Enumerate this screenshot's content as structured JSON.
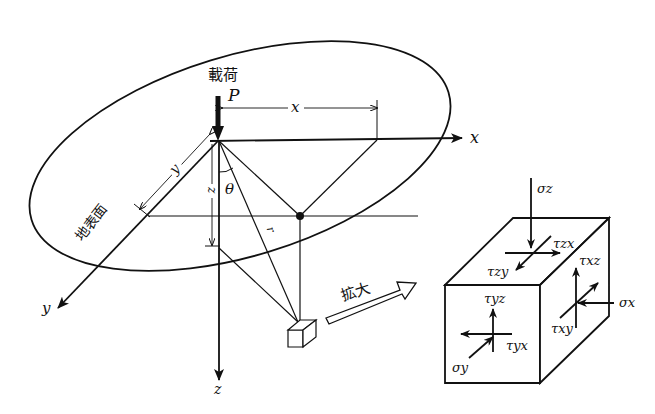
{
  "diagram": {
    "load_label": "載荷",
    "load_symbol": "P",
    "surface_label": "地表面",
    "enlarge_label": "拡大",
    "axes": {
      "x": "x",
      "y": "y",
      "z": "z"
    },
    "dimensions": {
      "x": "x",
      "y": "y",
      "z": "z",
      "r": "r",
      "theta": "θ"
    },
    "stress_element": {
      "sigma_z": "σz",
      "tau_zx": "τzx",
      "tau_zy": "τzy",
      "tau_xz": "τxz",
      "sigma_x": "σx",
      "tau_xy": "τxy",
      "tau_yz": "τyz",
      "tau_yx": "τyx",
      "sigma_y": "σy"
    },
    "colors": {
      "line": "#111111",
      "background": "#ffffff"
    }
  }
}
